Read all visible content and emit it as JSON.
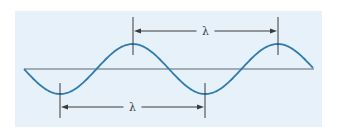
{
  "diagram": {
    "title": "",
    "panel": {
      "x": 15,
      "y": 11,
      "width": 307,
      "height": 116,
      "fill": "#e6f1f9"
    },
    "baseline": {
      "x1": 24,
      "x2": 314,
      "y": 69,
      "color": "#5a6a75"
    },
    "wave": {
      "color": "#2f7bb0",
      "start_x": 24,
      "end_x": 313,
      "baseline_y": 69,
      "amplitude": 25,
      "wavelength": 145,
      "starts_going": "down"
    },
    "top_measure": {
      "label": "λ",
      "from_x": 133,
      "to_x": 278,
      "y": 31,
      "tick_top": 17,
      "tick_bottom": 55,
      "description": "crest to crest"
    },
    "bottom_measure": {
      "label": "λ",
      "from_x": 60,
      "to_x": 205,
      "y": 107,
      "tick_top": 83,
      "tick_bottom": 118,
      "description": "trough to trough"
    },
    "ink_color": "#3a3a3a"
  }
}
